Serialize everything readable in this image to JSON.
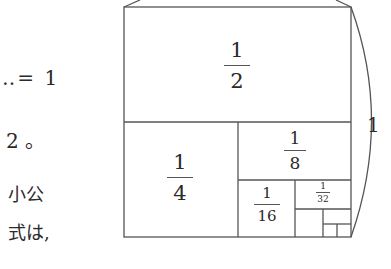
{
  "left_text": {
    "line1": "‥= 1",
    "line2": "2 。",
    "line3": "小公",
    "line4": "式は,"
  },
  "diagram": {
    "side_label": "1",
    "cells": [
      {
        "num": "1",
        "den": "2"
      },
      {
        "num": "1",
        "den": "4"
      },
      {
        "num": "1",
        "den": "8"
      },
      {
        "num": "1",
        "den": "16"
      },
      {
        "num": "1",
        "den": "32"
      }
    ],
    "line_color": "#555555"
  }
}
